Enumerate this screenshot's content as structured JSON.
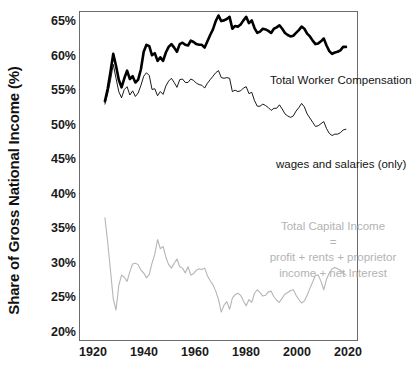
{
  "chart_data": {
    "type": "line",
    "title": "",
    "xlabel": "",
    "ylabel": "Share of Gross National Income (%)",
    "xlim": [
      1920,
      2020
    ],
    "ylim": [
      20,
      67
    ],
    "grid": false,
    "legend_position": "inline-annotations",
    "x_ticks": [
      "1920",
      "1940",
      "1960",
      "1980",
      "2000",
      "2020"
    ],
    "y_ticks": [
      "20%",
      "25%",
      "30%",
      "35%",
      "40%",
      "45%",
      "50%",
      "55%",
      "60%",
      "65%"
    ],
    "annotations": [
      {
        "name": "total-worker-compensation",
        "text": "Total Worker Compensation",
        "color": "#141414"
      },
      {
        "name": "wages-and-salaries",
        "text": "wages and salaries (only)",
        "color": "#141414"
      },
      {
        "name": "total-capital-income-line1",
        "text": "Total Capital Income",
        "color": "#b3b3b3"
      },
      {
        "name": "total-capital-income-line2",
        "text": "=",
        "color": "#b3b3b3"
      },
      {
        "name": "total-capital-income-line3",
        "text": "profit + rents + proprietor",
        "color": "#b3b3b3"
      },
      {
        "name": "total-capital-income-line4",
        "text": "income + net Interest",
        "color": "#b3b3b3"
      }
    ],
    "x": [
      1929,
      1930,
      1931,
      1932,
      1933,
      1934,
      1935,
      1936,
      1937,
      1938,
      1939,
      1940,
      1941,
      1942,
      1943,
      1944,
      1945,
      1946,
      1947,
      1948,
      1949,
      1950,
      1951,
      1952,
      1953,
      1954,
      1955,
      1956,
      1957,
      1958,
      1959,
      1960,
      1961,
      1962,
      1963,
      1964,
      1965,
      1966,
      1967,
      1968,
      1969,
      1970,
      1971,
      1972,
      1973,
      1974,
      1975,
      1976,
      1977,
      1978,
      1979,
      1980,
      1981,
      1982,
      1983,
      1984,
      1985,
      1986,
      1987,
      1988,
      1989,
      1990,
      1991,
      1992,
      1993,
      1994,
      1995,
      1996,
      1997,
      1998,
      1999,
      2000,
      2001,
      2002,
      2003,
      2004,
      2005,
      2006,
      2007,
      2008,
      2009,
      2010,
      2011,
      2012,
      2013,
      2014,
      2015,
      2016
    ],
    "series": [
      {
        "name": "Total Worker Compensation",
        "color": "#000000",
        "linewidth": 2.6,
        "values": [
          54.2,
          56.0,
          58.4,
          61.0,
          59.3,
          57.3,
          56.2,
          57.5,
          58.6,
          57.4,
          57.8,
          56.9,
          57.3,
          58.8,
          61.3,
          62.3,
          62.1,
          60.8,
          61.1,
          60.0,
          60.5,
          60.0,
          61.2,
          62.0,
          62.4,
          61.9,
          61.3,
          62.4,
          62.6,
          62.3,
          62.2,
          62.9,
          62.7,
          62.4,
          62.3,
          62.3,
          61.9,
          62.8,
          63.7,
          64.5,
          65.7,
          66.5,
          65.7,
          65.8,
          66.0,
          66.3,
          64.6,
          65.0,
          64.9,
          65.2,
          65.8,
          66.3,
          65.4,
          65.8,
          64.7,
          64.0,
          64.2,
          64.6,
          64.5,
          64.3,
          64.0,
          64.6,
          64.8,
          65.1,
          64.6,
          64.0,
          63.7,
          63.5,
          63.6,
          64.0,
          64.4,
          64.9,
          64.6,
          63.9,
          63.5,
          62.9,
          62.4,
          62.5,
          62.8,
          63.2,
          62.2,
          61.4,
          61.0,
          61.2,
          61.3,
          61.5,
          62.0,
          62.0
        ]
      },
      {
        "name": "wages and salaries (only)",
        "color": "#000000",
        "linewidth": 0.9,
        "values": [
          53.8,
          55.3,
          57.2,
          59.5,
          57.5,
          55.6,
          54.7,
          55.9,
          56.3,
          55.1,
          55.7,
          54.9,
          55.4,
          56.5,
          57.8,
          58.3,
          57.9,
          55.9,
          56.0,
          55.0,
          55.6,
          55.2,
          56.4,
          57.1,
          57.5,
          56.9,
          56.2,
          57.3,
          57.4,
          56.9,
          56.9,
          57.4,
          57.2,
          56.8,
          56.6,
          56.5,
          56.1,
          56.8,
          57.3,
          57.8,
          58.3,
          58.6,
          57.6,
          57.5,
          57.6,
          57.5,
          55.6,
          55.8,
          55.6,
          55.7,
          56.1,
          56.3,
          55.3,
          55.5,
          54.3,
          53.5,
          53.5,
          53.8,
          53.6,
          53.3,
          52.9,
          53.2,
          53.2,
          53.7,
          53.1,
          52.4,
          52.1,
          51.9,
          52.1,
          52.8,
          53.3,
          53.9,
          53.4,
          52.4,
          51.8,
          51.2,
          50.6,
          50.7,
          51.0,
          51.3,
          50.3,
          49.6,
          49.3,
          49.5,
          49.5,
          49.7,
          50.1,
          50.2
        ]
      },
      {
        "name": "Total Capital Income",
        "color": "#b5b5b5",
        "linewidth": 1.1,
        "values": [
          37.5,
          34.0,
          30.0,
          25.9,
          24.3,
          27.8,
          29.3,
          29.0,
          28.4,
          29.8,
          30.9,
          31.0,
          30.8,
          30.0,
          29.6,
          28.9,
          29.4,
          31.0,
          32.3,
          34.4,
          33.1,
          33.4,
          31.9,
          30.8,
          30.3,
          31.0,
          31.6,
          30.5,
          30.3,
          29.6,
          30.5,
          29.3,
          29.5,
          30.0,
          30.2,
          30.1,
          30.3,
          29.2,
          28.5,
          27.9,
          27.0,
          25.8,
          24.0,
          25.0,
          25.5,
          24.4,
          26.0,
          26.5,
          26.7,
          26.4,
          25.6,
          24.9,
          25.8,
          25.4,
          26.7,
          27.2,
          26.8,
          26.3,
          26.4,
          26.9,
          27.0,
          26.2,
          25.7,
          25.4,
          26.0,
          26.6,
          26.8,
          27.1,
          27.2,
          26.4,
          25.8,
          25.3,
          25.6,
          26.4,
          27.4,
          28.3,
          29.3,
          29.3,
          28.4,
          27.2,
          28.7,
          29.6,
          30.2,
          30.4,
          30.2,
          30.0,
          29.6,
          29.3
        ]
      }
    ]
  }
}
